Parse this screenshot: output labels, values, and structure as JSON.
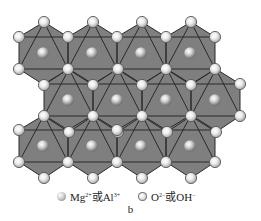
{
  "figure": {
    "label": "b",
    "background": "#ffffff",
    "face_color": "#7f7f7f",
    "edge_color": "#2a2a2a"
  },
  "legend": {
    "cation": {
      "base": "Mg",
      "sup1": "2+",
      "join": "或",
      "base2": "Al",
      "sup2": "3+"
    },
    "anion": {
      "base": "O",
      "sup1": "2−",
      "join": "或",
      "base2": "OH",
      "sup2": "−"
    }
  },
  "lattice": {
    "description": "Layered double hydroxide (brucite-like) layer viewed along c-axis: edge-sharing MO6 octahedra",
    "cation_sites": [
      [
        43,
        53
      ],
      [
        92,
        53
      ],
      [
        141,
        53
      ],
      [
        190,
        53
      ],
      [
        68,
        100
      ],
      [
        117,
        100
      ],
      [
        166,
        100
      ],
      [
        215,
        100
      ],
      [
        43,
        146
      ],
      [
        92,
        146
      ],
      [
        141,
        146
      ],
      [
        190,
        146
      ]
    ],
    "rows": {
      "A": {
        "y": 22,
        "x": [
          44,
          93,
          142,
          191
        ]
      },
      "B": {
        "y": 37,
        "x": [
          19,
          68,
          117,
          166,
          215
        ]
      },
      "C": {
        "y": 69,
        "x": [
          19,
          68,
          117,
          166,
          215
        ]
      },
      "D": {
        "y": 85,
        "x": [
          44,
          93,
          142,
          191,
          240
        ]
      },
      "E": {
        "y": 115,
        "x": [
          44,
          93,
          142,
          191,
          240
        ]
      },
      "F": {
        "y": 131,
        "x": [
          19,
          68,
          117,
          166,
          215
        ]
      },
      "G": {
        "y": 161,
        "x": [
          19,
          68,
          117,
          166,
          215
        ]
      },
      "H": {
        "y": 177,
        "x": [
          44,
          93,
          142,
          191
        ]
      }
    }
  }
}
